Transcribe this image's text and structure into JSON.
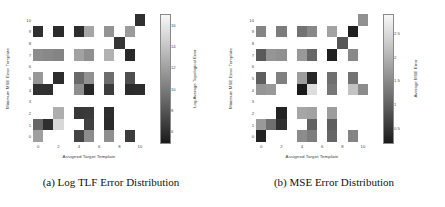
{
  "figure": {
    "panels": [
      {
        "id": "panel-a",
        "caption": "(a) Log TLF Error Distribution",
        "xlabel": "Assigned Target Template",
        "ylabel": "Minimum MSE Error Template",
        "xticks": [
          "0",
          "2",
          "4",
          "6",
          "8",
          "10"
        ],
        "yticks": [
          "0",
          "1",
          "2",
          "3",
          "4",
          "5",
          "6",
          "7",
          "8",
          "9",
          "10"
        ],
        "colorbar": {
          "label": "Log Average Topological Error",
          "ticks": [
            "6",
            "8",
            "10",
            "12",
            "14",
            "16"
          ]
        }
      },
      {
        "id": "panel-b",
        "caption": "(b) MSE Error Distribution",
        "xlabel": "Assigned Target Template",
        "ylabel": "Minimum MSE Error Template",
        "xticks": [
          "0",
          "2",
          "4",
          "6",
          "8",
          "10"
        ],
        "yticks": [
          "0",
          "1",
          "2",
          "3",
          "4",
          "5",
          "6",
          "7",
          "8",
          "9",
          "10"
        ],
        "colorbar": {
          "label": "Average MSE Error",
          "ticks": [
            "0.5",
            "1",
            "1.5",
            "2",
            "2.5"
          ]
        }
      }
    ]
  },
  "chart_data": [
    {
      "type": "heatmap",
      "title": "(a) Log TLF Error Distribution",
      "xlabel": "Assigned Target Template",
      "ylabel": "Minimum MSE Error Template",
      "cbar_label": "Log Average Topological Error",
      "xlim": [
        -0.5,
        10.5
      ],
      "ylim": [
        -0.5,
        10.5
      ],
      "zlim": [
        5.0,
        17.0
      ],
      "xticks": [
        0,
        2,
        4,
        6,
        8,
        10
      ],
      "yticks": [
        0,
        1,
        2,
        3,
        4,
        5,
        6,
        7,
        8,
        9,
        10
      ],
      "cbar_ticks": [
        6,
        8,
        10,
        12,
        14,
        16
      ],
      "grid": false,
      "cells": [
        {
          "x": 0,
          "y": 9,
          "v": 6.5
        },
        {
          "x": 2,
          "y": 9,
          "v": 6.3
        },
        {
          "x": 4,
          "y": 9,
          "v": 6.4
        },
        {
          "x": 5,
          "y": 9,
          "v": 12.8
        },
        {
          "x": 7,
          "y": 9,
          "v": 11.8
        },
        {
          "x": 9,
          "y": 9,
          "v": 12.2
        },
        {
          "x": 10,
          "y": 10,
          "v": 6.6
        },
        {
          "x": 8,
          "y": 8,
          "v": 6.9
        },
        {
          "x": 0,
          "y": 7,
          "v": 11.4
        },
        {
          "x": 1,
          "y": 7,
          "v": 11.2
        },
        {
          "x": 2,
          "y": 7,
          "v": 11.0
        },
        {
          "x": 4,
          "y": 7,
          "v": 12.6
        },
        {
          "x": 5,
          "y": 7,
          "v": 11.6
        },
        {
          "x": 7,
          "y": 7,
          "v": 13.4
        },
        {
          "x": 9,
          "y": 7,
          "v": 6.2
        },
        {
          "x": 0,
          "y": 5,
          "v": 12.0
        },
        {
          "x": 2,
          "y": 5,
          "v": 6.4
        },
        {
          "x": 4,
          "y": 5,
          "v": 9.6
        },
        {
          "x": 5,
          "y": 5,
          "v": 11.7
        },
        {
          "x": 7,
          "y": 5,
          "v": 9.8
        },
        {
          "x": 9,
          "y": 5,
          "v": 8.2
        },
        {
          "x": 0,
          "y": 4,
          "v": 6.6
        },
        {
          "x": 1,
          "y": 4,
          "v": 6.5
        },
        {
          "x": 4,
          "y": 4,
          "v": 11.5
        },
        {
          "x": 5,
          "y": 4,
          "v": 6.1
        },
        {
          "x": 7,
          "y": 4,
          "v": 7.2
        },
        {
          "x": 9,
          "y": 4,
          "v": 6.3
        },
        {
          "x": 10,
          "y": 4,
          "v": 6.4
        },
        {
          "x": 2,
          "y": 2,
          "v": 13.2
        },
        {
          "x": 4,
          "y": 2,
          "v": 7.0
        },
        {
          "x": 5,
          "y": 2,
          "v": 7.1
        },
        {
          "x": 7,
          "y": 2,
          "v": 6.4
        },
        {
          "x": 0,
          "y": 1,
          "v": 9.4
        },
        {
          "x": 1,
          "y": 1,
          "v": 6.5
        },
        {
          "x": 2,
          "y": 1,
          "v": 15.4
        },
        {
          "x": 5,
          "y": 1,
          "v": 7.4
        },
        {
          "x": 7,
          "y": 1,
          "v": 6.3
        },
        {
          "x": 0,
          "y": 0,
          "v": 12.4
        },
        {
          "x": 4,
          "y": 0,
          "v": 7.6
        },
        {
          "x": 5,
          "y": 0,
          "v": 11.4
        },
        {
          "x": 7,
          "y": 0,
          "v": 11.6
        },
        {
          "x": 9,
          "y": 0,
          "v": 7.2
        }
      ]
    },
    {
      "type": "heatmap",
      "title": "(b) MSE Error Distribution",
      "xlabel": "Assigned Target Template",
      "ylabel": "Minimum MSE Error Template",
      "cbar_label": "Average MSE Error",
      "xlim": [
        -0.5,
        10.5
      ],
      "ylim": [
        -0.5,
        10.5
      ],
      "zlim": [
        0.2,
        2.9
      ],
      "xticks": [
        0,
        2,
        4,
        6,
        8,
        10
      ],
      "yticks": [
        0,
        1,
        2,
        3,
        4,
        5,
        6,
        7,
        8,
        9,
        10
      ],
      "cbar_ticks": [
        0.5,
        1.0,
        1.5,
        2.0,
        2.5
      ],
      "grid": false,
      "cells": [
        {
          "x": 0,
          "y": 9,
          "v": 1.55
        },
        {
          "x": 2,
          "y": 9,
          "v": 1.45
        },
        {
          "x": 4,
          "y": 9,
          "v": 1.35
        },
        {
          "x": 5,
          "y": 9,
          "v": 1.6
        },
        {
          "x": 7,
          "y": 9,
          "v": 1.9
        },
        {
          "x": 9,
          "y": 9,
          "v": 0.35
        },
        {
          "x": 10,
          "y": 10,
          "v": 1.7
        },
        {
          "x": 8,
          "y": 8,
          "v": 1.0
        },
        {
          "x": 0,
          "y": 7,
          "v": 1.05
        },
        {
          "x": 1,
          "y": 7,
          "v": 1.75
        },
        {
          "x": 2,
          "y": 7,
          "v": 1.7
        },
        {
          "x": 4,
          "y": 7,
          "v": 1.8
        },
        {
          "x": 5,
          "y": 7,
          "v": 1.2
        },
        {
          "x": 7,
          "y": 7,
          "v": 0.35
        },
        {
          "x": 9,
          "y": 7,
          "v": 1.6
        },
        {
          "x": 0,
          "y": 5,
          "v": 1.1
        },
        {
          "x": 2,
          "y": 5,
          "v": 1.5
        },
        {
          "x": 4,
          "y": 5,
          "v": 1.85
        },
        {
          "x": 5,
          "y": 5,
          "v": 0.45
        },
        {
          "x": 7,
          "y": 5,
          "v": 1.3
        },
        {
          "x": 9,
          "y": 5,
          "v": 1.35
        },
        {
          "x": 0,
          "y": 4,
          "v": 1.75
        },
        {
          "x": 1,
          "y": 4,
          "v": 1.8
        },
        {
          "x": 4,
          "y": 4,
          "v": 0.3
        },
        {
          "x": 5,
          "y": 4,
          "v": 2.6
        },
        {
          "x": 7,
          "y": 4,
          "v": 1.4
        },
        {
          "x": 9,
          "y": 4,
          "v": 2.3
        },
        {
          "x": 10,
          "y": 4,
          "v": 1.65
        },
        {
          "x": 2,
          "y": 2,
          "v": 0.4
        },
        {
          "x": 4,
          "y": 2,
          "v": 1.95
        },
        {
          "x": 5,
          "y": 2,
          "v": 1.9
        },
        {
          "x": 7,
          "y": 2,
          "v": 1.85
        },
        {
          "x": 0,
          "y": 1,
          "v": 1.8
        },
        {
          "x": 1,
          "y": 1,
          "v": 1.3
        },
        {
          "x": 2,
          "y": 1,
          "v": 0.55
        },
        {
          "x": 5,
          "y": 1,
          "v": 1.15
        },
        {
          "x": 7,
          "y": 1,
          "v": 1.1
        },
        {
          "x": 0,
          "y": 0,
          "v": 0.4
        },
        {
          "x": 4,
          "y": 0,
          "v": 1.65
        },
        {
          "x": 5,
          "y": 0,
          "v": 1.45
        },
        {
          "x": 7,
          "y": 0,
          "v": 1.2
        },
        {
          "x": 9,
          "y": 0,
          "v": 1.55
        }
      ]
    }
  ]
}
